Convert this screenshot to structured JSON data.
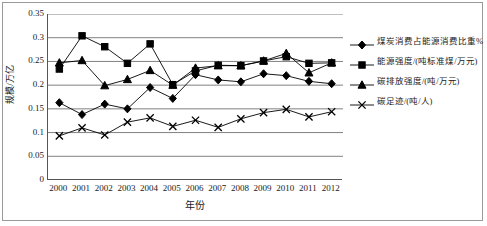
{
  "chart_data": {
    "type": "line",
    "title": "",
    "xlabel": "年份",
    "ylabel": "规模/万亿",
    "x": [
      2000,
      2001,
      2002,
      2003,
      2004,
      2005,
      2006,
      2007,
      2008,
      2009,
      2010,
      2011,
      2012
    ],
    "categories": [
      "2000",
      "2001",
      "2002",
      "2003",
      "2004",
      "2005",
      "2006",
      "2007",
      "2008",
      "2009",
      "2010",
      "2011",
      "2012"
    ],
    "ylim": [
      0,
      0.35
    ],
    "yticks": [
      0,
      0.05,
      0.1,
      0.15,
      0.2,
      0.25,
      0.3,
      0.35
    ],
    "ytick_labels": [
      "0",
      "0.05",
      "0.1",
      "0.15",
      "0.2",
      "0.25",
      "0.3",
      "0.35"
    ],
    "grid": true,
    "grid_axis": "y",
    "legend_position": "right",
    "series": [
      {
        "name": "煤炭消费占能源消费比重%",
        "marker": "diamond",
        "color": "#000000",
        "values": [
          0.163,
          0.138,
          0.16,
          0.15,
          0.195,
          0.172,
          0.222,
          0.211,
          0.207,
          0.224,
          0.22,
          0.208,
          0.203
        ]
      },
      {
        "name": "能源强度/(吨标准煤/万元)",
        "marker": "square",
        "color": "#000000",
        "values": [
          0.234,
          0.304,
          0.281,
          0.246,
          0.287,
          0.201,
          0.23,
          0.242,
          0.241,
          0.251,
          0.26,
          0.246,
          0.247
        ]
      },
      {
        "name": "碳排放强度/(吨/万元)",
        "marker": "triangle",
        "color": "#000000",
        "values": [
          0.247,
          0.252,
          0.199,
          0.212,
          0.231,
          0.2,
          0.236,
          0.241,
          0.241,
          0.251,
          0.267,
          0.226,
          0.247
        ]
      },
      {
        "name": "碳足迹/(吨/人)",
        "marker": "cross",
        "color": "#000000",
        "values": [
          0.093,
          0.11,
          0.095,
          0.122,
          0.131,
          0.113,
          0.126,
          0.111,
          0.129,
          0.142,
          0.149,
          0.133,
          0.144
        ]
      }
    ]
  },
  "legend": {
    "items": [
      {
        "label": "煤炭消费占能源消费比重%",
        "marker": "diamond"
      },
      {
        "label": "能源强度/(吨标准煤/万元)",
        "marker": "square"
      },
      {
        "label": "碳排放强度/(吨/万元)",
        "marker": "triangle"
      },
      {
        "label": "碳足迹/(吨/人)",
        "marker": "cross"
      }
    ]
  }
}
